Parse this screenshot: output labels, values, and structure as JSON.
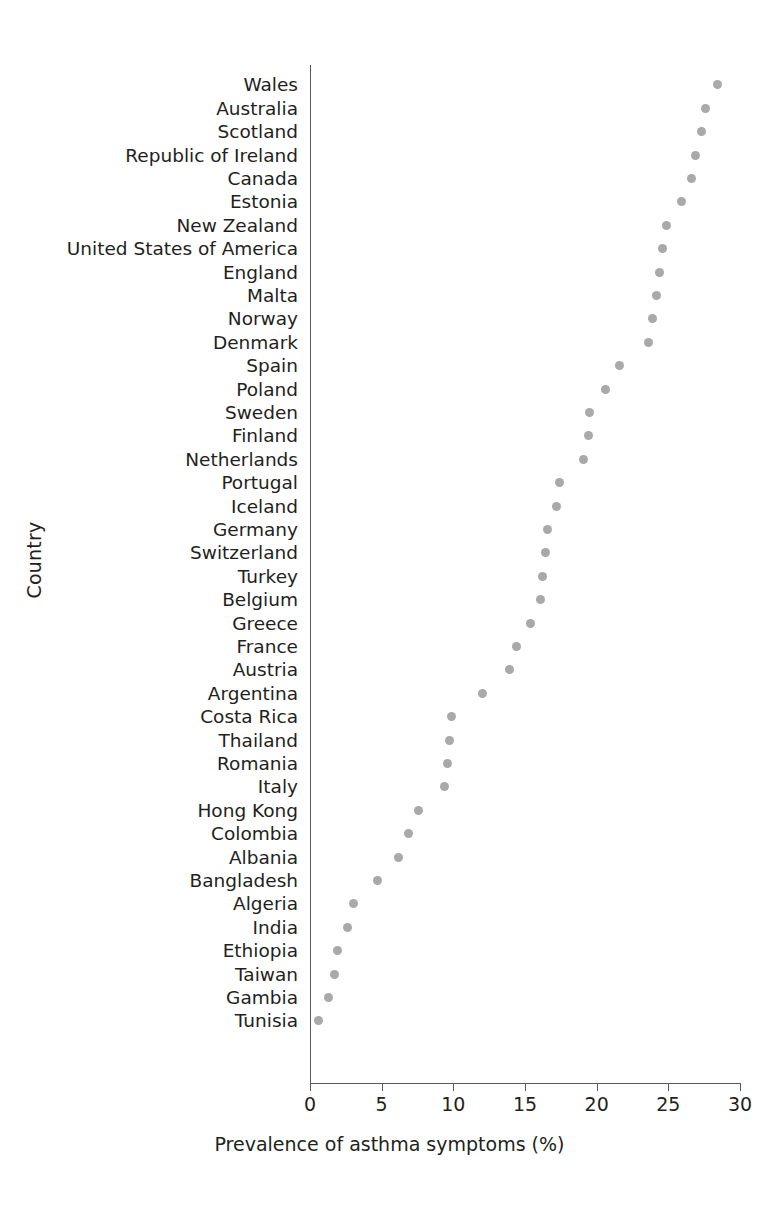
{
  "chart_data": {
    "type": "scatter",
    "plot_style": "dot-plot",
    "title": "",
    "xlabel": "Prevalence of asthma symptoms (%)",
    "ylabel": "Country",
    "xlim": [
      0,
      30
    ],
    "xticks": [
      0,
      5,
      10,
      15,
      20,
      25,
      30
    ],
    "xticklabels": [
      "0",
      "5",
      "10",
      "15",
      "20",
      "25",
      "30"
    ],
    "grid": false,
    "legend": null,
    "marker": {
      "shape": "circle",
      "color": "#a9a9a9",
      "size_px": 9
    },
    "axis_color": "#58595b",
    "text_color": "#231f20",
    "background": "#ffffff",
    "sort_order": "descending",
    "categories": [
      "Wales",
      "Australia",
      "Scotland",
      "Republic of Ireland",
      "Canada",
      "Estonia",
      "New Zealand",
      "United States of America",
      "England",
      "Malta",
      "Norway",
      "Denmark",
      "Spain",
      "Poland",
      "Sweden",
      "Finland",
      "Netherlands",
      "Portugal",
      "Iceland",
      "Germany",
      "Switzerland",
      "Turkey",
      "Belgium",
      "Greece",
      "France",
      "Austria",
      "Argentina",
      "Costa Rica",
      "Thailand",
      "Romania",
      "Italy",
      "Hong Kong",
      "Colombia",
      "Albania",
      "Bangladesh",
      "Algeria",
      "India",
      "Ethiopia",
      "Taiwan",
      "Gambia",
      "Tunisia"
    ],
    "values": [
      28.4,
      27.6,
      27.3,
      26.9,
      26.6,
      25.9,
      24.9,
      24.6,
      24.4,
      24.2,
      23.9,
      23.6,
      21.6,
      20.6,
      19.5,
      19.4,
      19.1,
      17.4,
      17.2,
      16.6,
      16.4,
      16.2,
      16.1,
      15.4,
      14.4,
      13.9,
      12.0,
      9.9,
      9.7,
      9.6,
      9.4,
      7.6,
      6.9,
      6.2,
      4.7,
      3.0,
      2.6,
      1.9,
      1.7,
      1.3,
      0.6
    ]
  }
}
